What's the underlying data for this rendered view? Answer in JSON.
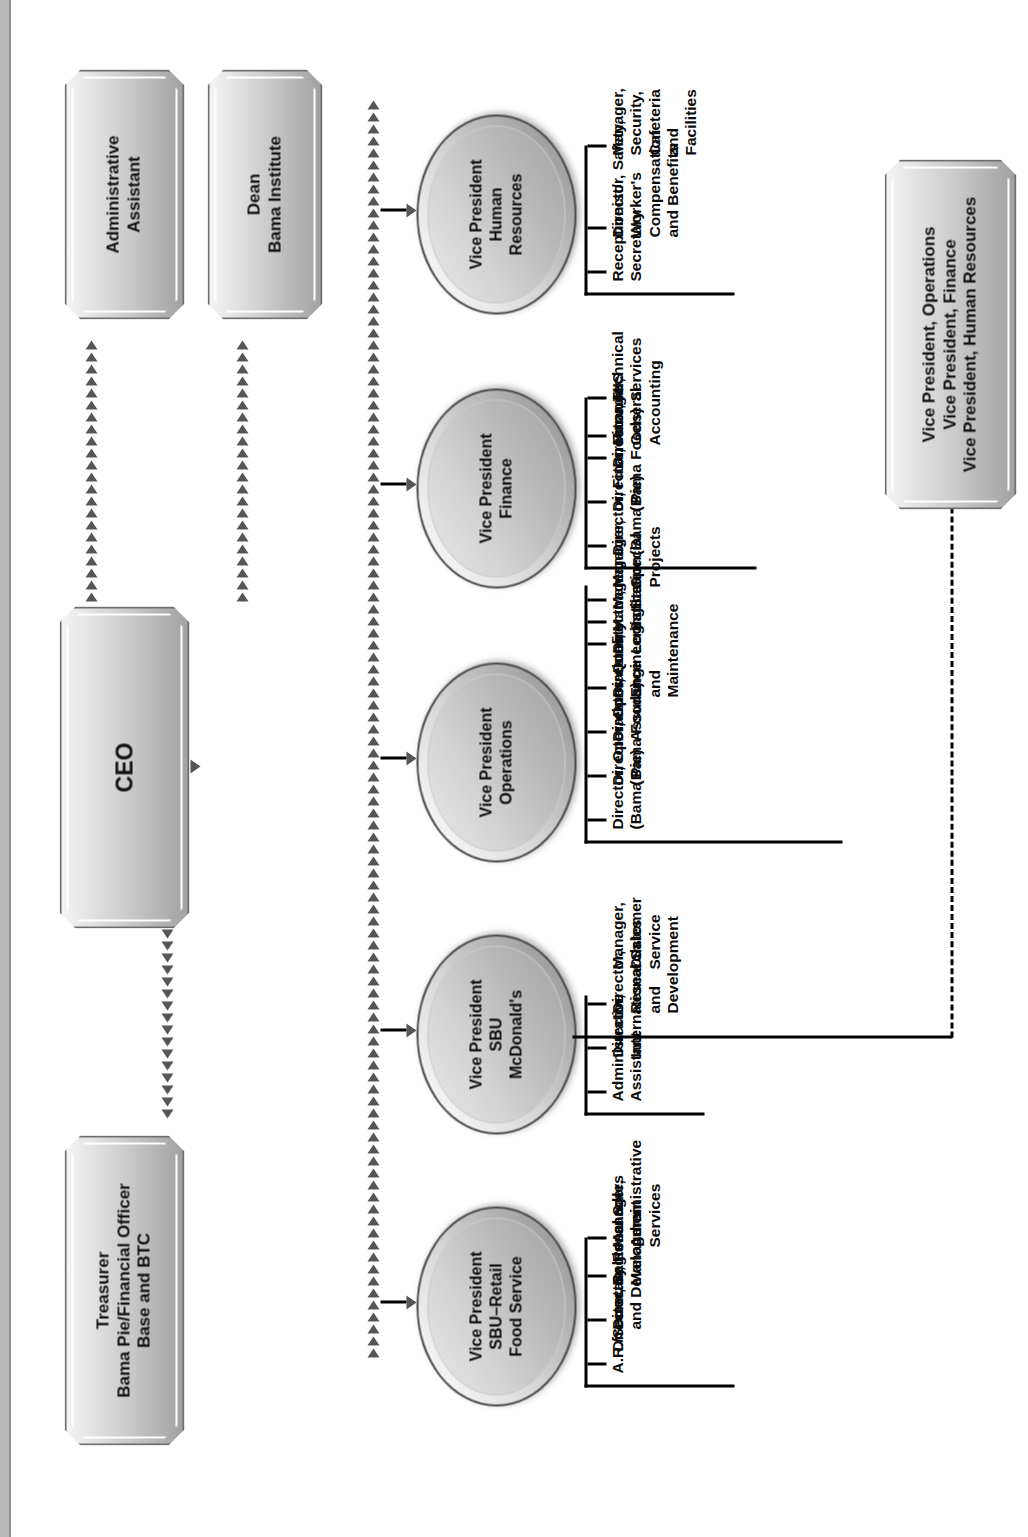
{
  "chart_title": "Bama Companies Organization Chart",
  "nodes": {
    "ceo": {
      "label": "CEO"
    },
    "admin_assistant": {
      "label": "Administrative\nAssistant"
    },
    "dean": {
      "label": "Dean\nBama Institute"
    },
    "treasurer": {
      "label": "Treasurer\nBama Pie/Financial Officer\nBase and BTC"
    },
    "dotted_box": {
      "label": "Vice President, Operations\nVice President, Finance\nVice President, Human Resources"
    }
  },
  "vice_presidents": [
    {
      "id": "vp-retail-food-service",
      "label": "Vice President\nSBU–Retail\nFood Service",
      "reports": [
        "A.R./Secretary",
        "Director, Sales",
        "Director, Research\nand Development",
        "Regional Sales\nManagers",
        "Manager,\nAdministrative\nServices"
      ]
    },
    {
      "id": "vp-sbu-mcdonalds",
      "label": "Vice President\nSBU\nMcDonald's",
      "reports": [
        "Administrative\nAssistant",
        "Director,\nInternational Sales",
        "Director, Research\nand Development",
        "Manager, Customer\nService"
      ]
    },
    {
      "id": "vp-operations",
      "label": "Vice President\nOperations",
      "reports": [
        "Director, Operations\n(Bama Pie)",
        "Director, Operations\n(Bama Foods)",
        "Director, Quality\nAssurance",
        "Director, Engineering\nand Maintenance",
        "Director, Logistics",
        "Manager, Sanitation",
        "Manager, Base",
        "Manager, Special\nProjects"
      ]
    },
    {
      "id": "vp-finance",
      "label": "Vice President\nFinance",
      "reports": [
        "Director, Finance\n(Bama Pie)",
        "Director, Finance\n(Bama Foods)",
        "Director, MIS",
        "Manager, General\nAccounting",
        "Technical Services"
      ]
    },
    {
      "id": "vp-human-resources",
      "label": "Vice President\nHuman\nResources",
      "reports": [
        "Receptionist/\nSecretary",
        "Director, Safety,\nWorker's\nCompensation\nand Benefits",
        "Manager,\nSecurity,\nCafeteria and\nFacilities"
      ]
    }
  ],
  "colors": {
    "box_border": "#6e6e6e",
    "ellipse_border": "#4a4a4a",
    "arrow": "#565656",
    "line": "#000000",
    "text": "#0d0d0d",
    "page_background": "#ffffff"
  }
}
